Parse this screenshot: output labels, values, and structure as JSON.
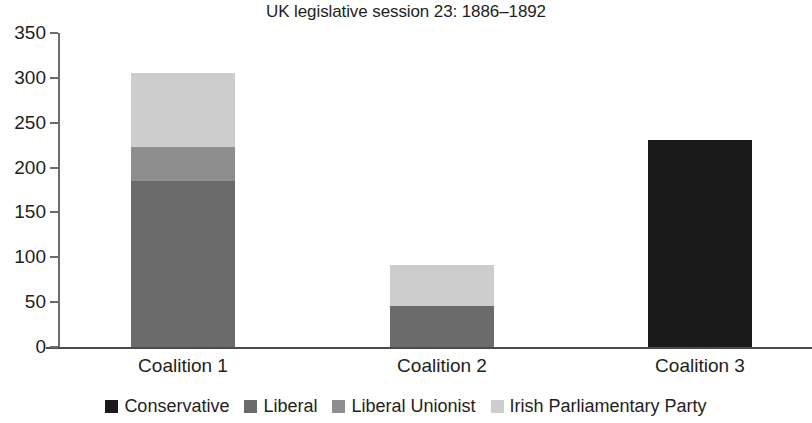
{
  "chart_data": {
    "type": "bar",
    "subtype": "stacked",
    "title": "UK legislative session 23: 1886–1892",
    "xlabel": "",
    "ylabel": "",
    "categories": [
      "Coalition 1",
      "Coalition 2",
      "Coalition 3"
    ],
    "series": [
      {
        "name": "Conservative",
        "color": "#1a1a1a",
        "values": [
          0,
          0,
          231
        ]
      },
      {
        "name": "Liberal",
        "color": "#6b6b6b",
        "values": [
          185,
          46,
          0
        ]
      },
      {
        "name": "Liberal Unionist",
        "color": "#8e8e8e",
        "values": [
          38,
          0,
          0
        ]
      },
      {
        "name": "Irish Parliamentary Party",
        "color": "#cdcdcd",
        "values": [
          82,
          45,
          0
        ]
      }
    ],
    "totals": [
      305,
      91,
      231
    ],
    "ylim": [
      0,
      350
    ],
    "yticks": [
      0,
      50,
      100,
      150,
      200,
      250,
      300,
      350
    ],
    "ytick_labels": [
      "0",
      "50",
      "100",
      "150",
      "200",
      "250",
      "300",
      "350"
    ],
    "grid": false,
    "legend_position": "bottom"
  },
  "legend": {
    "items": [
      {
        "label": "Conservative",
        "color": "#1a1a1a",
        "swatch_name": "legend-swatch-conservative"
      },
      {
        "label": "Liberal",
        "color": "#6b6b6b",
        "swatch_name": "legend-swatch-liberal"
      },
      {
        "label": "Liberal Unionist",
        "color": "#8e8e8e",
        "swatch_name": "legend-swatch-liberal-unionist"
      },
      {
        "label": "Irish Parliamentary Party",
        "color": "#cdcdcd",
        "swatch_name": "legend-swatch-irish-parliamentary-party"
      }
    ]
  },
  "axis": {
    "y_tick_labels": [
      "350",
      "300",
      "250",
      "200",
      "150",
      "100",
      "50",
      "0"
    ],
    "x_tick_labels": [
      "Coalition 1",
      "Coalition 2",
      "Coalition 3"
    ]
  }
}
